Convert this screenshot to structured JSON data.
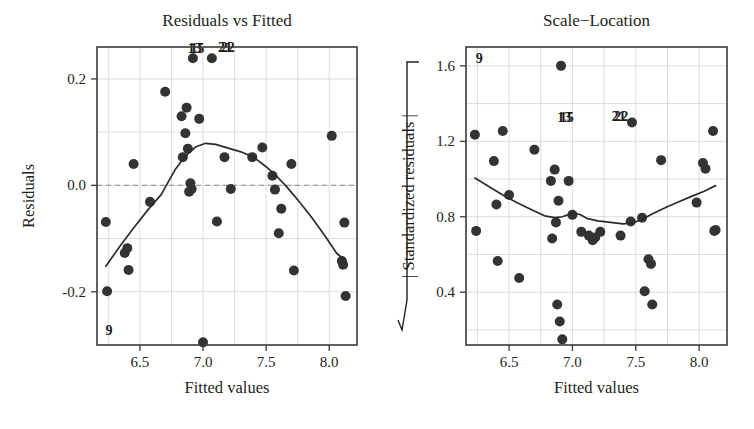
{
  "figure": {
    "background": "#ffffff",
    "point_color": "#333333",
    "line_color": "#2b2b2b",
    "grid_color": "#d8d8d8",
    "reference_line_color": "#9a9a9a"
  },
  "chart_data": [
    {
      "type": "scatter",
      "panel": "left",
      "title": "Residuals vs Fitted",
      "xlabel": "Fitted values",
      "ylabel": "Residuals",
      "xlim": [
        6.16,
        8.22
      ],
      "ylim": [
        -0.3,
        0.26
      ],
      "xticks": [
        6.5,
        7.0,
        7.5,
        8.0
      ],
      "xtick_labels": [
        "6.5",
        "7.0",
        "7.5",
        "8.0"
      ],
      "yticks": [
        0.2,
        0.0,
        -0.2
      ],
      "ytick_labels": [
        "0.2",
        "0.0",
        "-0.2"
      ],
      "grid": true,
      "legend": "none",
      "reference_line": {
        "type": "horizontal",
        "y": 0.0,
        "style": "dashed"
      },
      "x": [
        6.23,
        6.24,
        6.38,
        6.4,
        6.41,
        6.45,
        6.58,
        6.7,
        6.83,
        6.84,
        6.86,
        6.87,
        6.88,
        6.89,
        6.9,
        6.91,
        6.92,
        6.97,
        7.0,
        7.07,
        7.11,
        7.17,
        7.22,
        7.39,
        7.47,
        7.55,
        7.57,
        7.6,
        7.62,
        7.7,
        7.72,
        8.02,
        8.1,
        8.11,
        8.12,
        8.13
      ],
      "y": [
        -0.069,
        -0.199,
        -0.127,
        -0.118,
        -0.159,
        0.04,
        -0.031,
        0.176,
        0.13,
        0.053,
        0.098,
        0.146,
        0.069,
        -0.012,
        0.004,
        -0.007,
        0.239,
        0.125,
        -0.295,
        0.239,
        -0.068,
        0.053,
        -0.007,
        0.053,
        0.071,
        0.018,
        -0.008,
        -0.09,
        -0.044,
        0.04,
        -0.16,
        0.093,
        -0.142,
        -0.149,
        -0.07,
        -0.208
      ],
      "point_labels": [
        {
          "text": "13",
          "x": 6.935,
          "y": 0.248
        },
        {
          "text": "15",
          "x": 6.955,
          "y": 0.248
        },
        {
          "text": "21",
          "x": 7.175,
          "y": 0.25
        },
        {
          "text": "22",
          "x": 7.195,
          "y": 0.25
        },
        {
          "text": "9",
          "x": 6.255,
          "y": -0.281
        }
      ],
      "smoother": {
        "name": "loess",
        "x": [
          6.23,
          6.34,
          6.45,
          6.56,
          6.67,
          6.78,
          6.86,
          6.94,
          7.02,
          7.1,
          7.2,
          7.3,
          7.4,
          7.5,
          7.58,
          7.66,
          7.76,
          7.86,
          7.96,
          8.06,
          8.13
        ],
        "y": [
          -0.152,
          -0.115,
          -0.08,
          -0.047,
          -0.017,
          0.03,
          0.055,
          0.072,
          0.079,
          0.077,
          0.07,
          0.063,
          0.053,
          0.035,
          0.018,
          -0.002,
          -0.03,
          -0.06,
          -0.093,
          -0.128,
          -0.141
        ]
      }
    },
    {
      "type": "scatter",
      "panel": "right",
      "title": "Scale−Location",
      "xlabel": "Fitted values",
      "ylabel": "√| Standardized residuals |",
      "xlim": [
        6.16,
        8.22
      ],
      "ylim": [
        0.12,
        1.7
      ],
      "xticks": [
        6.5,
        7.0,
        7.5,
        8.0
      ],
      "xtick_labels": [
        "6.5",
        "7.0",
        "7.5",
        "8.0"
      ],
      "yticks": [
        1.6,
        1.2,
        0.8,
        0.4
      ],
      "ytick_labels": [
        "1.6",
        "1.2",
        "0.8",
        "0.4"
      ],
      "grid": true,
      "legend": "none",
      "x": [
        6.23,
        6.24,
        6.38,
        6.4,
        6.41,
        6.45,
        6.5,
        6.58,
        6.7,
        6.83,
        6.84,
        6.86,
        6.87,
        6.88,
        6.89,
        6.9,
        6.91,
        6.92,
        6.97,
        7.0,
        7.07,
        7.13,
        7.16,
        7.18,
        7.22,
        7.38,
        7.46,
        7.47,
        7.55,
        7.57,
        7.6,
        7.62,
        7.63,
        7.7,
        7.98,
        8.03,
        8.05,
        8.11,
        8.12,
        8.13
      ],
      "y": [
        1.235,
        0.725,
        1.095,
        0.865,
        0.565,
        1.255,
        0.915,
        0.475,
        1.155,
        0.99,
        0.685,
        1.05,
        0.77,
        0.335,
        0.885,
        0.245,
        1.6,
        0.15,
        0.99,
        0.81,
        0.72,
        0.7,
        0.675,
        0.69,
        0.72,
        0.7,
        0.775,
        1.3,
        0.795,
        0.405,
        0.575,
        0.55,
        0.335,
        1.1,
        0.875,
        1.085,
        1.055,
        1.255,
        0.725,
        0.73
      ],
      "point_labels": [
        {
          "text": "9",
          "x": 6.265,
          "y": 1.615
        },
        {
          "text": "13",
          "x": 6.935,
          "y": 1.305
        },
        {
          "text": "15",
          "x": 6.955,
          "y": 1.305
        },
        {
          "text": "21",
          "x": 7.365,
          "y": 1.31
        },
        {
          "text": "22",
          "x": 7.385,
          "y": 1.31
        }
      ],
      "smoother": {
        "name": "loess",
        "x": [
          6.23,
          6.34,
          6.45,
          6.56,
          6.67,
          6.78,
          6.86,
          6.92,
          7.0,
          7.06,
          7.12,
          7.2,
          7.3,
          7.4,
          7.48,
          7.56,
          7.64,
          7.74,
          7.84,
          7.94,
          8.04,
          8.13
        ],
        "y": [
          1.005,
          0.96,
          0.915,
          0.875,
          0.84,
          0.805,
          0.795,
          0.8,
          0.818,
          0.812,
          0.79,
          0.778,
          0.77,
          0.762,
          0.768,
          0.79,
          0.818,
          0.85,
          0.88,
          0.908,
          0.935,
          0.965
        ]
      }
    }
  ]
}
